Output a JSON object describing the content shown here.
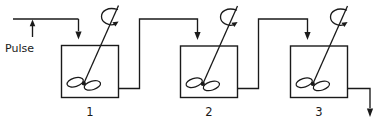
{
  "diagram": {
    "type": "process-flow-diagram",
    "colors": {
      "line": "#1a1a1a",
      "background": "#ffffff"
    },
    "input": {
      "label": "Pulse",
      "inlet_arrow_name": "pulse-inlet-arrow",
      "marker_arrow_name": "pulse-marker-arrow"
    },
    "tanks": [
      {
        "number": "1",
        "name": "tank-1",
        "agitator": "stirrer-impeller",
        "rotation_indicator": "rotation-arrow"
      },
      {
        "number": "2",
        "name": "tank-2",
        "agitator": "stirrer-impeller",
        "rotation_indicator": "rotation-arrow"
      },
      {
        "number": "3",
        "name": "tank-3",
        "agitator": "stirrer-impeller",
        "rotation_indicator": "rotation-arrow"
      }
    ],
    "connections": [
      {
        "name": "pipe-tank1-to-tank2",
        "from": "1",
        "to": "2"
      },
      {
        "name": "pipe-tank2-to-tank3",
        "from": "2",
        "to": "3"
      },
      {
        "name": "pipe-tank3-outlet",
        "from": "3",
        "to": "outlet"
      }
    ]
  }
}
